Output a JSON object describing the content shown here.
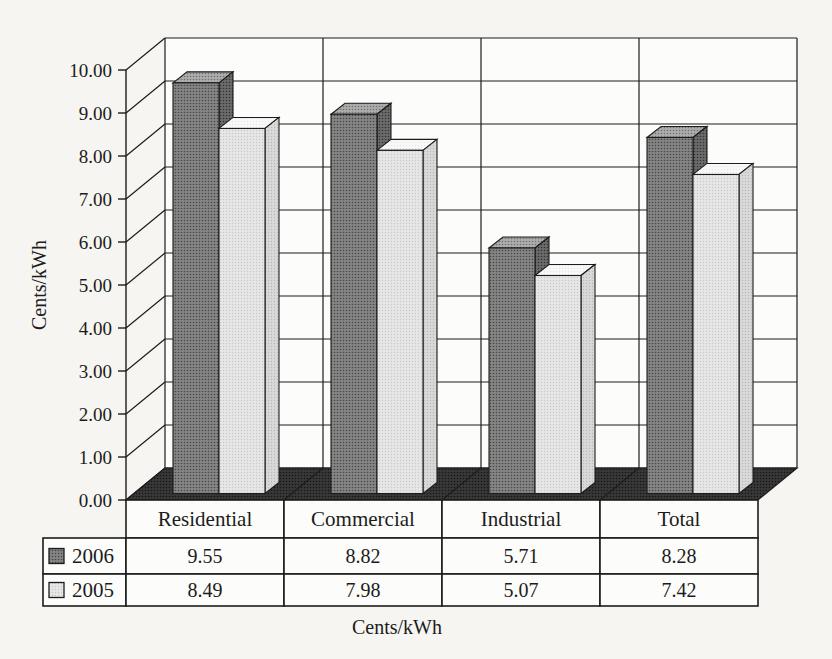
{
  "page": {
    "kind": "scanned 3-D clustered column chart with data table",
    "background_color": "#f6f5f1"
  },
  "chart_data": {
    "type": "bar",
    "style": "3d-column",
    "title": "",
    "categories": [
      "Residential",
      "Commercial",
      "Industrial",
      "Total"
    ],
    "series": [
      {
        "name": "2006",
        "values": [
          9.55,
          8.82,
          5.71,
          8.28
        ],
        "color": "#8a8a8a"
      },
      {
        "name": "2005",
        "values": [
          8.49,
          7.98,
          5.07,
          7.42
        ],
        "color": "#e6e6e6"
      }
    ],
    "ylabel": "Cents/kWh",
    "xlabel": "Cents/kWh",
    "ylim": [
      0,
      10
    ],
    "ytick_step": 1,
    "yticks": [
      "0.00",
      "1.00",
      "2.00",
      "3.00",
      "4.00",
      "5.00",
      "6.00",
      "7.00",
      "8.00",
      "9.00",
      "10.00"
    ],
    "grid": true,
    "legend": [
      "2006",
      "2005"
    ],
    "legend_position": "left column of data table",
    "data_table_shown": true,
    "value_format": "2 decimal places"
  },
  "colors": {
    "line": "#1c1c1c",
    "wall": "#fcfcfa",
    "floor": "#383838",
    "bar_2006_front": "#858585",
    "bar_2006_top": "#adadad",
    "bar_2006_side": "#6b6b6b",
    "bar_2005_front": "#e7e7e7",
    "bar_2005_top": "#f8f8f8",
    "bar_2005_side": "#d9d9d9",
    "text": "#1c1c1c"
  }
}
